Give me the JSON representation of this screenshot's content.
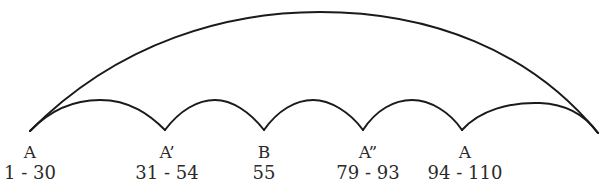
{
  "diagram": {
    "type": "arc-form-diagram",
    "colors": {
      "stroke": "#1a1a1a",
      "text": "#2a2a2a",
      "background": "#ffffff"
    },
    "sections": [
      {
        "letter": "A",
        "range": "1 - 30",
        "x": 30
      },
      {
        "letter": "A’",
        "range": "31 - 54",
        "x": 165
      },
      {
        "letter": "B",
        "range": "55",
        "x": 264
      },
      {
        "letter": "A”",
        "range": "79 - 93",
        "x": 363
      },
      {
        "letter": "A",
        "range": "94 - 110",
        "x": 462
      }
    ]
  }
}
